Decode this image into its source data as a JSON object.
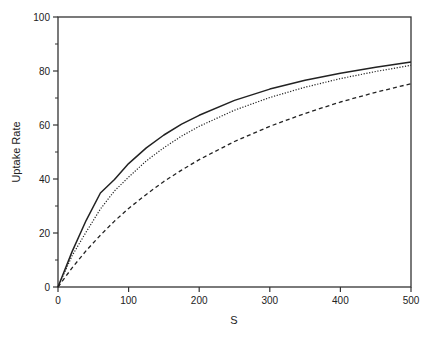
{
  "chart_data": {
    "type": "line",
    "title": "",
    "xlabel": "S",
    "ylabel": "Uptake Rate",
    "xlim": [
      0,
      500
    ],
    "ylim": [
      0,
      100
    ],
    "x_ticks": [
      0,
      100,
      200,
      300,
      400,
      500
    ],
    "y_ticks": [
      0,
      20,
      40,
      60,
      80,
      100
    ],
    "y_minor_ticks": [
      10,
      30,
      50,
      70,
      90
    ],
    "grid": false,
    "legend": null,
    "x": [
      0,
      20,
      40,
      60,
      80,
      100,
      125,
      150,
      175,
      200,
      250,
      300,
      350,
      400,
      450,
      500
    ],
    "series": [
      {
        "name": "solid",
        "style": "solid",
        "values": [
          0,
          13.1,
          24.7,
          34.8,
          39.8,
          45.7,
          51.5,
          56.3,
          60.3,
          63.6,
          69.1,
          73.3,
          76.6,
          79.2,
          81.4,
          83.3
        ]
      },
      {
        "name": "dotted",
        "style": "dotted",
        "values": [
          0,
          11.6,
          20.4,
          28.9,
          35.6,
          40.7,
          46.7,
          51.6,
          55.9,
          59.5,
          65.5,
          70.2,
          74.0,
          77.2,
          79.8,
          82.1
        ]
      },
      {
        "name": "dashed",
        "style": "dashed",
        "values": [
          0,
          7.1,
          13.5,
          19.2,
          24.4,
          29.1,
          34.3,
          39.1,
          43.3,
          47.2,
          53.9,
          59.5,
          64.3,
          68.5,
          72.1,
          75.3
        ]
      }
    ],
    "colors": {
      "axis": "#333333",
      "lines": "#222222",
      "background": "#ffffff"
    }
  }
}
